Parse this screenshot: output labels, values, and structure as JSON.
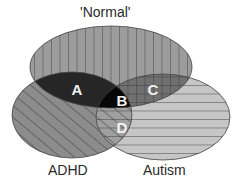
{
  "diagram": {
    "type": "venn",
    "sets": [
      {
        "id": "normal",
        "label": "'Normal'",
        "pattern": "vertical-lines",
        "fill": "#9a9a9a"
      },
      {
        "id": "adhd",
        "label": "ADHD",
        "pattern": "diagonal-lines",
        "fill": "#8a8a8a"
      },
      {
        "id": "autism",
        "label": "Autism",
        "pattern": "horizontal-lines",
        "fill": "#c4c4c4"
      }
    ],
    "regions": [
      {
        "label": "A",
        "sets": [
          "normal",
          "adhd"
        ],
        "fill": "#262626"
      },
      {
        "label": "B",
        "sets": [
          "normal",
          "adhd",
          "autism"
        ],
        "fill": "#080808"
      },
      {
        "label": "C",
        "sets": [
          "normal",
          "autism"
        ],
        "fill": "#6e6e6e"
      },
      {
        "label": "D",
        "sets": [
          "adhd",
          "autism"
        ],
        "fill": "#9c9c9c"
      }
    ]
  }
}
